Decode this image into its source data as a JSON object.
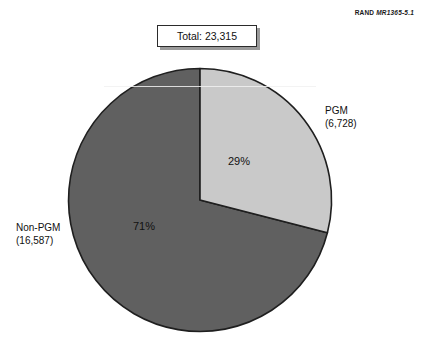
{
  "figure": {
    "source_tag_word": "RAND",
    "source_tag_number": "MR1365-5.1",
    "total_label": "Total:  23,315"
  },
  "chart_data": {
    "type": "pie",
    "title": "",
    "total": 23315,
    "total_display": "23,315",
    "start_angle_deg": 0,
    "direction": "clockwise",
    "legend": "outside-labels",
    "grid": false,
    "categories": [
      "PGM",
      "Non-PGM"
    ],
    "values": [
      6728,
      16587
    ],
    "percent_values": [
      29,
      71
    ],
    "slices": [
      {
        "label": "PGM",
        "value": 6728,
        "value_display": "(6,728)",
        "percent": 29,
        "percent_display": "29%",
        "color": "#c9c9c9",
        "start_deg": 0,
        "end_deg": 104.4
      },
      {
        "label": "Non-PGM",
        "value": 16587,
        "value_display": "(16,587)",
        "percent": 71,
        "percent_display": "71%",
        "color": "#606060",
        "start_deg": 104.4,
        "end_deg": 360
      }
    ],
    "colors": {
      "pgm": "#c9c9c9",
      "non_pgm": "#606060",
      "outline": "#1f1f1f"
    }
  }
}
